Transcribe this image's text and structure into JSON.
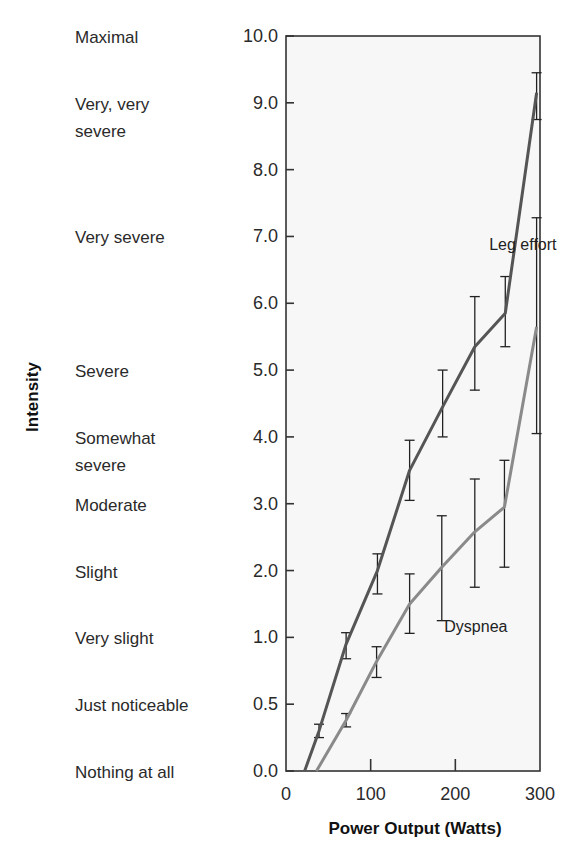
{
  "chart_data": {
    "type": "line",
    "title": "",
    "xlabel": "Power Output (Watts)",
    "ylabel": "Intensity",
    "xlim": [
      0,
      300
    ],
    "x_ticks": [
      0,
      100,
      200,
      300
    ],
    "y_scale_note": "Borg CR10 category-ratio scale; tick positions evenly spaced",
    "y_ticks": [
      "0.0",
      "0.5",
      "1.0",
      "2.0",
      "3.0",
      "4.0",
      "5.0",
      "6.0",
      "7.0",
      "8.0",
      "9.0",
      "10.0"
    ],
    "y_tick_values": [
      0.0,
      0.5,
      1.0,
      2.0,
      3.0,
      4.0,
      5.0,
      6.0,
      7.0,
      8.0,
      9.0,
      10.0
    ],
    "y_descriptors": [
      {
        "value": 0.0,
        "lines": [
          "Nothing at all"
        ]
      },
      {
        "value": 0.5,
        "lines": [
          "Just noticeable"
        ]
      },
      {
        "value": 1.0,
        "lines": [
          "Very slight"
        ]
      },
      {
        "value": 2.0,
        "lines": [
          "Slight"
        ]
      },
      {
        "value": 3.0,
        "lines": [
          "Moderate"
        ]
      },
      {
        "value": 4.0,
        "lines": [
          "Somewhat",
          "severe"
        ]
      },
      {
        "value": 5.0,
        "lines": [
          "Severe"
        ]
      },
      {
        "value": 7.0,
        "lines": [
          "Very severe"
        ]
      },
      {
        "value": 9.0,
        "lines": [
          "Very, very",
          "severe"
        ]
      },
      {
        "value": 10.0,
        "lines": [
          "Maximal"
        ]
      }
    ],
    "grid": false,
    "legend": "inline labels",
    "series": [
      {
        "name": "Leg effort",
        "color": "#555555",
        "label_pos": {
          "x": 240,
          "value": 6.8
        },
        "line_start": {
          "x": 22,
          "y": 0.0
        },
        "points": [
          {
            "x": 39,
            "y": 0.3,
            "err_low": 0.25,
            "err_high": 0.35
          },
          {
            "x": 71,
            "y": 0.95,
            "err_low": 0.84,
            "err_high": 1.07
          },
          {
            "x": 108,
            "y": 2.0,
            "err_low": 1.65,
            "err_high": 2.25
          },
          {
            "x": 146,
            "y": 3.5,
            "err_low": 3.05,
            "err_high": 3.95
          },
          {
            "x": 185,
            "y": 4.45,
            "err_low": 4.0,
            "err_high": 5.0
          },
          {
            "x": 223,
            "y": 5.35,
            "err_low": 4.7,
            "err_high": 6.1
          },
          {
            "x": 259,
            "y": 5.85,
            "err_low": 5.35,
            "err_high": 6.4
          },
          {
            "x": 296,
            "y": 9.15,
            "err_low": 8.75,
            "err_high": 9.45
          }
        ]
      },
      {
        "name": "Dyspnea",
        "color": "#8a8a8a",
        "label_pos": {
          "x": 187,
          "value": 1.08
        },
        "line_start": {
          "x": 36,
          "y": 0.0
        },
        "points": [
          {
            "x": 71,
            "y": 0.38,
            "err_low": 0.33,
            "err_high": 0.43
          },
          {
            "x": 107,
            "y": 0.82,
            "err_low": 0.7,
            "err_high": 0.93
          },
          {
            "x": 146,
            "y": 1.5,
            "err_low": 1.06,
            "err_high": 1.95
          },
          {
            "x": 184,
            "y": 2.05,
            "err_low": 1.25,
            "err_high": 2.82
          },
          {
            "x": 223,
            "y": 2.58,
            "err_low": 1.75,
            "err_high": 3.37
          },
          {
            "x": 258,
            "y": 2.95,
            "err_low": 2.05,
            "err_high": 3.65
          },
          {
            "x": 296,
            "y": 5.65,
            "err_low": 4.05,
            "err_high": 7.28
          }
        ]
      }
    ]
  },
  "axes": {
    "x_title": "Power Output (Watts)",
    "y_title": "Intensity"
  },
  "style": {
    "plot_background": "#f7f7f7",
    "axis_color": "#333333"
  }
}
